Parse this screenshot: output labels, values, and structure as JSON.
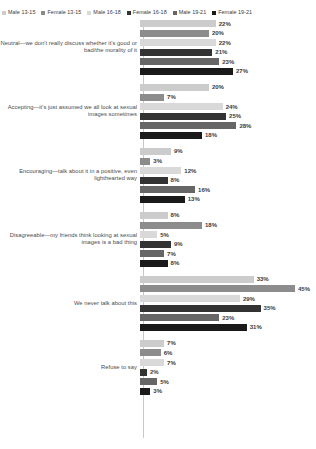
{
  "legend": {
    "position": "top",
    "items": [
      {
        "label": "Male 13-15",
        "color": "#cccccc"
      },
      {
        "label": "Female 13-15",
        "color": "#8c8c8c"
      },
      {
        "label": "Male 16-18",
        "color": "#d9d9d9"
      },
      {
        "label": "Female 16-18",
        "color": "#333333"
      },
      {
        "label": "Male 19-21",
        "color": "#666666"
      },
      {
        "label": "Female 19-21",
        "color": "#1a1a1a"
      }
    ]
  },
  "chart_data": {
    "type": "bar",
    "orientation": "horizontal",
    "title": "",
    "xlabel": "",
    "ylabel": "",
    "grid": false,
    "legend_position": "top",
    "xlim": [
      0,
      45
    ],
    "value_suffix": "%",
    "series": [
      {
        "name": "Male 13-15",
        "color": "#cccccc",
        "values": [
          22,
          20,
          9,
          8,
          33,
          7
        ]
      },
      {
        "name": "Female 13-15",
        "color": "#8c8c8c",
        "values": [
          20,
          7,
          3,
          18,
          45,
          6
        ]
      },
      {
        "name": "Male 16-18",
        "color": "#d9d9d9",
        "values": [
          22,
          24,
          12,
          5,
          29,
          7
        ]
      },
      {
        "name": "Female 16-18",
        "color": "#333333",
        "values": [
          21,
          25,
          8,
          9,
          35,
          2
        ]
      },
      {
        "name": "Male 19-21",
        "color": "#666666",
        "values": [
          23,
          28,
          16,
          7,
          23,
          5
        ]
      },
      {
        "name": "Female 19-21",
        "color": "#1a1a1a",
        "values": [
          27,
          18,
          13,
          8,
          31,
          3
        ]
      }
    ],
    "categories": [
      "Neutral—we don't really discuss whether it's good or bad/the morality of it",
      "Accepting—it's just assumed we all look at sexual images sometimes",
      "Encouraging—talk about it in a positive, even lighthearted way",
      "Disagreeable—my friends think looking at sexual images is a bad thing",
      "We never talk about this",
      "Refuse to say"
    ],
    "groups": [
      {
        "category": "Neutral—we don't really discuss whether it's good or bad/the morality of it",
        "bars": [
          {
            "series": "Male 13-15",
            "value": 22,
            "label": "22%",
            "color": "#cccccc"
          },
          {
            "series": "Female 13-15",
            "value": 20,
            "label": "20%",
            "color": "#8c8c8c"
          },
          {
            "series": "Male 16-18",
            "value": 22,
            "label": "22%",
            "color": "#d9d9d9"
          },
          {
            "series": "Female 16-18",
            "value": 21,
            "label": "21%",
            "color": "#333333"
          },
          {
            "series": "Male 19-21",
            "value": 23,
            "label": "23%",
            "color": "#666666"
          },
          {
            "series": "Female 19-21",
            "value": 27,
            "label": "27%",
            "color": "#1a1a1a"
          }
        ]
      },
      {
        "category": "Accepting—it's just assumed we all look at sexual images sometimes",
        "bars": [
          {
            "series": "Male 13-15",
            "value": 20,
            "label": "20%",
            "color": "#cccccc"
          },
          {
            "series": "Female 13-15",
            "value": 7,
            "label": "7%",
            "color": "#8c8c8c"
          },
          {
            "series": "Male 16-18",
            "value": 24,
            "label": "24%",
            "color": "#d9d9d9"
          },
          {
            "series": "Female 16-18",
            "value": 25,
            "label": "25%",
            "color": "#333333"
          },
          {
            "series": "Male 19-21",
            "value": 28,
            "label": "28%",
            "color": "#666666"
          },
          {
            "series": "Female 19-21",
            "value": 18,
            "label": "18%",
            "color": "#1a1a1a"
          }
        ]
      },
      {
        "category": "Encouraging—talk about it in a positive, even lighthearted way",
        "bars": [
          {
            "series": "Male 13-15",
            "value": 9,
            "label": "9%",
            "color": "#cccccc"
          },
          {
            "series": "Female 13-15",
            "value": 3,
            "label": "3%",
            "color": "#8c8c8c"
          },
          {
            "series": "Male 16-18",
            "value": 12,
            "label": "12%",
            "color": "#d9d9d9"
          },
          {
            "series": "Female 16-18",
            "value": 8,
            "label": "8%",
            "color": "#333333"
          },
          {
            "series": "Male 19-21",
            "value": 16,
            "label": "16%",
            "color": "#666666"
          },
          {
            "series": "Female 19-21",
            "value": 13,
            "label": "13%",
            "color": "#1a1a1a"
          }
        ]
      },
      {
        "category": "Disagreeable—my friends think looking at sexual images is a bad thing",
        "bars": [
          {
            "series": "Male 13-15",
            "value": 8,
            "label": "8%",
            "color": "#cccccc"
          },
          {
            "series": "Female 13-15",
            "value": 18,
            "label": "18%",
            "color": "#8c8c8c"
          },
          {
            "series": "Male 16-18",
            "value": 5,
            "label": "5%",
            "color": "#d9d9d9"
          },
          {
            "series": "Female 16-18",
            "value": 9,
            "label": "9%",
            "color": "#333333"
          },
          {
            "series": "Male 19-21",
            "value": 7,
            "label": "7%",
            "color": "#666666"
          },
          {
            "series": "Female 19-21",
            "value": 8,
            "label": "8%",
            "color": "#1a1a1a"
          }
        ]
      },
      {
        "category": "We never talk about this",
        "bars": [
          {
            "series": "Male 13-15",
            "value": 33,
            "label": "33%",
            "color": "#cccccc"
          },
          {
            "series": "Female 13-15",
            "value": 45,
            "label": "45%",
            "color": "#8c8c8c"
          },
          {
            "series": "Male 16-18",
            "value": 29,
            "label": "29%",
            "color": "#d9d9d9"
          },
          {
            "series": "Female 16-18",
            "value": 35,
            "label": "35%",
            "color": "#333333"
          },
          {
            "series": "Male 19-21",
            "value": 23,
            "label": "23%",
            "color": "#666666"
          },
          {
            "series": "Female 19-21",
            "value": 31,
            "label": "31%",
            "color": "#1a1a1a"
          }
        ]
      },
      {
        "category": "Refuse to say",
        "bars": [
          {
            "series": "Male 13-15",
            "value": 7,
            "label": "7%",
            "color": "#cccccc"
          },
          {
            "series": "Female 13-15",
            "value": 6,
            "label": "6%",
            "color": "#8c8c8c"
          },
          {
            "series": "Male 16-18",
            "value": 7,
            "label": "7%",
            "color": "#d9d9d9"
          },
          {
            "series": "Female 16-18",
            "value": 2,
            "label": "2%",
            "color": "#333333"
          },
          {
            "series": "Male 19-21",
            "value": 5,
            "label": "5%",
            "color": "#666666"
          },
          {
            "series": "Female 19-21",
            "value": 3,
            "label": "3%",
            "color": "#1a1a1a"
          }
        ]
      }
    ]
  }
}
